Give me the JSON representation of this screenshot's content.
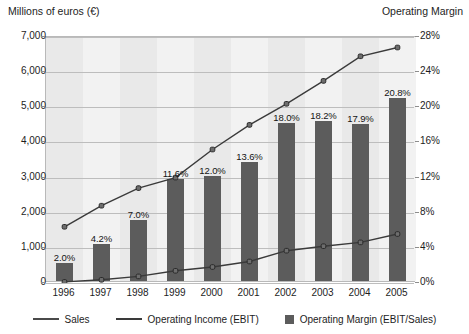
{
  "left_axis_title": "Millions of euros (€)",
  "right_axis_title": "Operating Margin",
  "legend": {
    "sales": "Sales",
    "ebit": "Operating Income (EBIT)",
    "margin": "Operating Margin (EBIT/Sales)"
  },
  "colors": {
    "bar": "#5c5c5c",
    "line": "#3a3a3a",
    "plot_bg": "#e9e9e9",
    "band": "#f2f2f2",
    "grid": "#bdbdbd"
  },
  "chart_data": {
    "type": "bar",
    "title": "",
    "subtitle": "",
    "xlabel": "",
    "ylabel": "Millions of euros (€)",
    "y2label": "Operating Margin",
    "grid": true,
    "legend_position": "bottom",
    "categories": [
      "1996",
      "1997",
      "1998",
      "1999",
      "2000",
      "2001",
      "2002",
      "2003",
      "2004",
      "2005"
    ],
    "ylim": [
      0,
      7000
    ],
    "yticks": [
      0,
      1000,
      2000,
      3000,
      4000,
      5000,
      6000,
      7000
    ],
    "ytick_labels": [
      "0",
      "1,000",
      "2,000",
      "3,000",
      "4,000",
      "5,000",
      "6,000",
      "7,000"
    ],
    "y2lim": [
      0,
      28
    ],
    "y2ticks": [
      0,
      4,
      8,
      12,
      16,
      20,
      24,
      28
    ],
    "y2tick_labels": [
      "0%",
      "4%",
      "8%",
      "12%",
      "16%",
      "20%",
      "24%",
      "28%"
    ],
    "series": [
      {
        "name": "Operating Margin (EBIT/Sales)",
        "type": "bar",
        "axis": "right",
        "unit": "%",
        "values": [
          2.0,
          4.2,
          7.0,
          11.6,
          12.0,
          13.6,
          18.0,
          18.2,
          17.9,
          20.8
        ],
        "data_labels": [
          "2.0%",
          "4.2%",
          "7.0%",
          "11.6%",
          "12.0%",
          "13.6%",
          "18.0%",
          "18.2%",
          "17.9%",
          "20.8%"
        ]
      },
      {
        "name": "Sales",
        "type": "line",
        "axis": "left",
        "unit": "millions of euros",
        "values": [
          1600,
          2200,
          2700,
          3000,
          3800,
          4500,
          5100,
          5750,
          6450,
          6700
        ]
      },
      {
        "name": "Operating Income (EBIT)",
        "type": "line",
        "axis": "left",
        "unit": "millions of euros",
        "values": [
          32,
          92,
          189,
          348,
          456,
          612,
          918,
          1047,
          1155,
          1394
        ]
      }
    ]
  }
}
